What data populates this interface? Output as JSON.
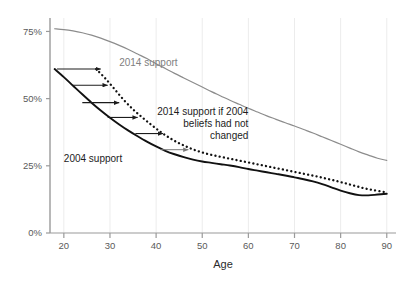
{
  "chart_data": {
    "type": "line",
    "title": "",
    "subtitle": "",
    "xlabel": "Age",
    "ylabel": "",
    "xlim": [
      17,
      92
    ],
    "ylim": [
      0,
      80
    ],
    "xticks": [
      20,
      30,
      40,
      50,
      60,
      70,
      80,
      90
    ],
    "xticklabels": [
      "20",
      "30",
      "40",
      "50",
      "60",
      "70",
      "80",
      "90"
    ],
    "yticks": [
      0,
      25,
      50,
      75
    ],
    "yticklabels": [
      "0%",
      "25%",
      "50%",
      "75%"
    ],
    "grid": "vertical-faint",
    "legend_position": "inline-annotations",
    "series": [
      {
        "name": "2014 support",
        "style": "solid",
        "color": "#8c8c8c",
        "x": [
          18,
          20,
          22,
          24,
          26,
          28,
          30,
          32,
          34,
          36,
          38,
          40,
          42,
          44,
          46,
          48,
          50,
          52,
          54,
          56,
          58,
          60,
          62,
          64,
          66,
          68,
          70,
          72,
          74,
          76,
          78,
          80,
          82,
          84,
          86,
          88,
          90
        ],
        "y": [
          76.0,
          75.7,
          75.2,
          74.5,
          73.6,
          72.5,
          71.2,
          69.8,
          68.3,
          66.6,
          64.9,
          63.0,
          61.2,
          59.4,
          57.7,
          56.0,
          54.3,
          52.6,
          51.0,
          49.4,
          47.9,
          46.4,
          45.0,
          43.6,
          42.3,
          41.0,
          39.8,
          38.5,
          37.2,
          35.8,
          34.4,
          33.0,
          31.6,
          30.2,
          29.0,
          27.8,
          27.0
        ]
      },
      {
        "name": "2014 support if 2004 beliefs had not changed",
        "style": "dotted",
        "color": "#111111",
        "x": [
          27,
          29,
          31,
          33,
          35,
          37,
          39,
          41,
          43,
          45,
          47,
          49,
          51,
          53,
          55,
          57,
          59,
          61,
          63,
          65,
          67,
          69,
          71,
          73,
          75,
          77,
          79,
          81,
          83,
          85,
          87,
          89,
          90
        ],
        "y": [
          61.0,
          57.5,
          53.5,
          49.5,
          46.0,
          43.0,
          40.2,
          37.6,
          35.3,
          33.4,
          31.8,
          30.5,
          29.5,
          28.7,
          28.0,
          27.3,
          26.6,
          25.9,
          25.2,
          24.5,
          23.8,
          23.1,
          22.4,
          21.7,
          21.0,
          20.2,
          19.4,
          18.5,
          17.6,
          16.7,
          16.0,
          15.4,
          15.2
        ]
      },
      {
        "name": "2004 support",
        "style": "solid",
        "color": "#111111",
        "x": [
          18,
          20,
          22,
          24,
          26,
          28,
          30,
          32,
          34,
          36,
          38,
          40,
          42,
          44,
          46,
          48,
          50,
          52,
          54,
          56,
          58,
          60,
          62,
          64,
          66,
          68,
          70,
          72,
          74,
          76,
          78,
          80,
          82,
          84,
          86,
          88,
          90
        ],
        "y": [
          61.0,
          58.0,
          54.8,
          51.6,
          48.5,
          45.6,
          42.9,
          40.4,
          38.1,
          36.0,
          34.0,
          32.2,
          30.6,
          29.3,
          28.2,
          27.3,
          26.6,
          26.1,
          25.6,
          25.1,
          24.5,
          23.8,
          23.2,
          22.6,
          22.0,
          21.4,
          20.7,
          20.0,
          19.2,
          18.2,
          17.0,
          15.8,
          14.8,
          14.1,
          14.0,
          14.3,
          14.6
        ]
      }
    ],
    "annotations": [
      {
        "name": "2014-support-label",
        "text": "2014 support",
        "x": 32.0,
        "y": 62.0,
        "color": "#808080",
        "anchor": "start"
      },
      {
        "name": "2004-support-label",
        "text": "2004 support",
        "x": 20.0,
        "y": 26.5,
        "color": "#1c1c1c",
        "anchor": "start"
      },
      {
        "name": "counterfactual-label-line1",
        "text": "2014 support if 2004",
        "x": 60.0,
        "y": 44.0,
        "color": "#1c1c1c",
        "anchor": "end"
      },
      {
        "name": "counterfactual-label-line2",
        "text": "beliefs had not",
        "x": 60.0,
        "y": 39.5,
        "color": "#1c1c1c",
        "anchor": "end"
      },
      {
        "name": "counterfactual-label-line3",
        "text": "changed",
        "x": 60.0,
        "y": 35.0,
        "color": "#1c1c1c",
        "anchor": "end"
      }
    ],
    "arrows": [
      {
        "name": "gap-arrow-1",
        "x_start": 18.5,
        "x_end": 28.0,
        "y": 61.0,
        "color": "#1c1c1c"
      },
      {
        "name": "gap-arrow-2",
        "x_start": 22.0,
        "x_end": 29.5,
        "y": 55.0,
        "color": "#1c1c1c"
      },
      {
        "name": "gap-arrow-3",
        "x_start": 24.0,
        "x_end": 32.0,
        "y": 48.5,
        "color": "#1c1c1c"
      },
      {
        "name": "gap-arrow-4",
        "x_start": 29.5,
        "x_end": 36.0,
        "y": 43.0,
        "color": "#1c1c1c"
      },
      {
        "name": "gap-arrow-5",
        "x_start": 35.5,
        "x_end": 41.5,
        "y": 37.0,
        "color": "#1c1c1c"
      },
      {
        "name": "gap-arrow-6",
        "x_start": 41.0,
        "x_end": 47.0,
        "y": 31.0,
        "color": "#7a7a7a"
      }
    ]
  }
}
